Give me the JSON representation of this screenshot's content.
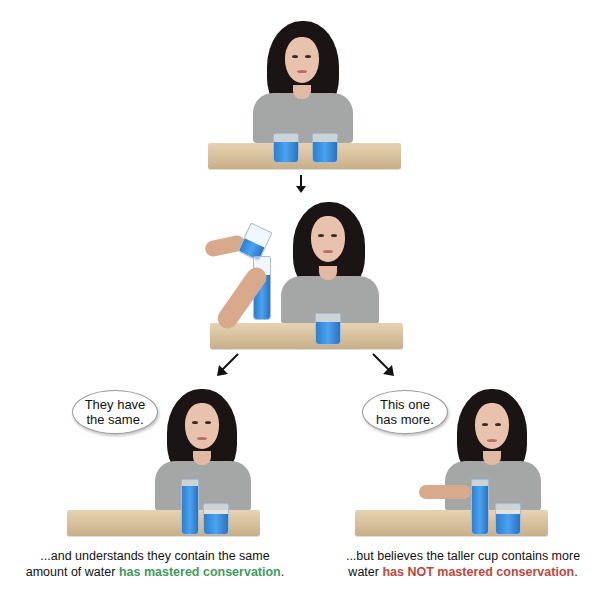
{
  "diagram": {
    "title_visible": false,
    "panels": {
      "top": {
        "description": "girl seated behind table with two equal short glasses of blue water"
      },
      "middle": {
        "description": "adult hands pour water from short glass into tall narrow glass while girl watches"
      },
      "bottom_left": {
        "speech": "They have the same.",
        "speech_line1": "They have",
        "speech_line2": "the same.",
        "caption_plain": "...and understands they contain the same amount of water",
        "caption_line1": "...and understands they contain the same",
        "caption_line2_plain": "amount of water",
        "caption_highlight": "has mastered conservation",
        "caption_end": ".",
        "highlight_color": "#3f9a5e"
      },
      "bottom_right": {
        "speech": "This one has more.",
        "speech_line1": "This one",
        "speech_line2": "has more.",
        "caption_plain": "...but believes the taller cup contains more water",
        "caption_line1": "...but believes the taller cup contains more",
        "caption_line2_plain": "water",
        "caption_highlight": "has NOT mastered conservation",
        "caption_end": ".",
        "highlight_color": "#c0473a"
      }
    },
    "arrows": [
      "down",
      "down-left",
      "down-right"
    ],
    "colors": {
      "water": "#3a8fe0",
      "table": "#d9c3a0",
      "hair": "#1a1414",
      "shirt": "#a5a7a6"
    }
  }
}
